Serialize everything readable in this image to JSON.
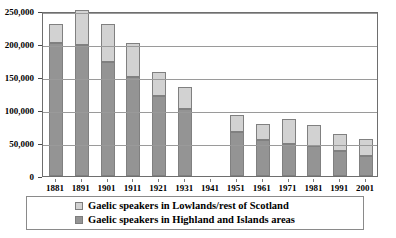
{
  "chart_data": {
    "type": "bar",
    "stacked": true,
    "title": "",
    "xlabel": "",
    "ylabel": "",
    "ylim": [
      0,
      250000
    ],
    "yticks": [
      0,
      50000,
      100000,
      150000,
      200000,
      250000
    ],
    "ytick_labels": [
      "0",
      "50,000",
      "100,000",
      "150,000",
      "200,000",
      "250,000"
    ],
    "grid": true,
    "legend_position": "bottom",
    "categories": [
      "1881",
      "1891",
      "1901",
      "1911",
      "1921",
      "1931",
      "1941",
      "1951",
      "1961",
      "1971",
      "1981",
      "1991",
      "2001"
    ],
    "series": [
      {
        "name": "Gaelic speakers in Highland and Islands areas",
        "color": "#949494",
        "values": [
          201000,
          198000,
          173000,
          150000,
          121000,
          101000,
          null,
          67000,
          55000,
          48000,
          45000,
          38000,
          31000
        ]
      },
      {
        "name": "Gaelic speakers in Lowlands/rest of Scotland",
        "color": "#d2d2d2",
        "values": [
          30000,
          54000,
          57000,
          51000,
          37000,
          34000,
          null,
          26000,
          24000,
          38000,
          33000,
          26000,
          25000
        ]
      }
    ],
    "totals": [
      231000,
      252000,
      230000,
      201000,
      158000,
      135000,
      null,
      93000,
      79000,
      86000,
      78000,
      64000,
      56000
    ]
  },
  "legend": {
    "entries": [
      {
        "label": "Gaelic speakers in Lowlands/rest of Scotland",
        "swatch": "light-gray-swatch"
      },
      {
        "label": "Gaelic speakers in Highland and Islands areas",
        "swatch": "dark-gray-swatch"
      }
    ]
  },
  "colors": {
    "highland": "#949494",
    "lowland": "#d2d2d2",
    "gridline": "#9a9a9a",
    "frame": "#6e6e6e",
    "text": "#000000",
    "background": "#ffffff"
  }
}
